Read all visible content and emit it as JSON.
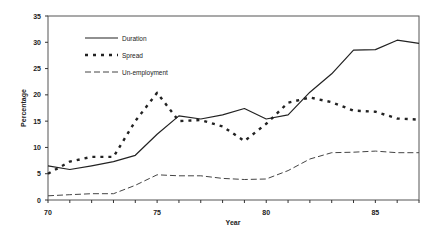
{
  "chart_data": {
    "type": "line",
    "title": "",
    "xlabel": "Year",
    "ylabel": "Percentage",
    "x": [
      70,
      71,
      72,
      73,
      74,
      75,
      76,
      77,
      78,
      79,
      80,
      81,
      82,
      83,
      84,
      85,
      86,
      87
    ],
    "x_tick_labels": [
      "70",
      "75",
      "80",
      "85"
    ],
    "y_tick_labels": [
      "0",
      "5",
      "10",
      "15",
      "20",
      "25",
      "30",
      "35"
    ],
    "xlim": [
      70,
      87
    ],
    "ylim": [
      0,
      35
    ],
    "grid": false,
    "legend_position": "upper-left-inside",
    "series": [
      {
        "name": "Duration",
        "style": "solid",
        "values": [
          6.5,
          5.8,
          6.5,
          7.3,
          8.5,
          12.5,
          16.0,
          15.4,
          16.2,
          17.4,
          15.4,
          16.2,
          20.5,
          24.0,
          28.5,
          28.6,
          30.4,
          29.8
        ]
      },
      {
        "name": "Spread",
        "style": "dotted",
        "values": [
          5.0,
          7.3,
          8.2,
          8.2,
          15.0,
          20.4,
          15.0,
          15.2,
          14.0,
          11.2,
          14.5,
          18.5,
          19.5,
          18.6,
          17.0,
          16.8,
          15.5,
          15.3
        ]
      },
      {
        "name": "Un-employment",
        "style": "dashed",
        "values": [
          0.8,
          1.0,
          1.2,
          1.2,
          2.8,
          4.8,
          4.6,
          4.6,
          4.1,
          3.9,
          4.0,
          5.6,
          7.8,
          9.0,
          9.1,
          9.3,
          9.0,
          9.0
        ]
      }
    ]
  }
}
